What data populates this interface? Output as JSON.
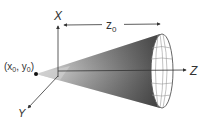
{
  "diagram": {
    "type": "3d-cone-geometry",
    "labels": {
      "x_axis": "X",
      "y_axis": "Y",
      "z_axis": "Z",
      "distance_main": "z",
      "distance_sub": "0",
      "apex_open": "(x",
      "apex_sub1": "0",
      "apex_mid": ", y",
      "apex_sub2": "0",
      "apex_close": ")"
    },
    "colors": {
      "cone_dark": "#5a5a5a",
      "cone_light": "#d6d6d6",
      "axis": "#333333",
      "mesh": "#888888",
      "base_fill": "#ffffff",
      "text": "#333333"
    }
  }
}
